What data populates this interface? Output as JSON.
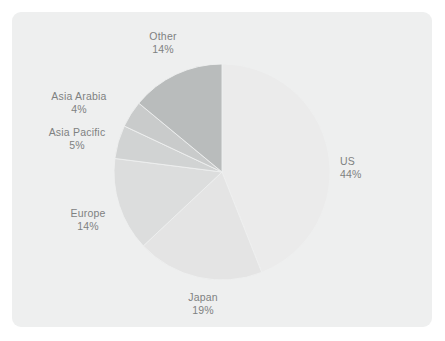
{
  "panel": {
    "background_color": "#eeefef",
    "page_background_color": "#ffffff"
  },
  "chart_data": {
    "type": "pie",
    "title": "",
    "subtitle": "",
    "xlabel": "",
    "ylabel": "",
    "legend_position": "none",
    "grid": false,
    "label_format": "name above percentage",
    "start_angle_deg": 0,
    "direction": "clockwise",
    "categories": [
      "US",
      "Japan",
      "Europe",
      "Asia Pacific",
      "Asia Arabia",
      "Other"
    ],
    "values": [
      44,
      19,
      14,
      5,
      4,
      14
    ],
    "unit": "%",
    "slices": [
      {
        "name": "US",
        "value": 44,
        "value_label": "44%",
        "color": "#ebebeb",
        "start_angle_deg": 0,
        "end_angle_deg": 158.4
      },
      {
        "name": "Japan",
        "value": 19,
        "value_label": "19%",
        "color": "#e4e4e4",
        "start_angle_deg": 158.4,
        "end_angle_deg": 226.8
      },
      {
        "name": "Europe",
        "value": 14,
        "value_label": "14%",
        "color": "#dcdddd",
        "start_angle_deg": 226.8,
        "end_angle_deg": 277.2
      },
      {
        "name": "Asia Pacific",
        "value": 5,
        "value_label": "5%",
        "color": "#d1d3d3",
        "start_angle_deg": 277.2,
        "end_angle_deg": 295.2
      },
      {
        "name": "Asia Arabia",
        "value": 4,
        "value_label": "4%",
        "color": "#c9cbcb",
        "start_angle_deg": 295.2,
        "end_angle_deg": 309.6
      },
      {
        "name": "Other",
        "value": 14,
        "value_label": "14%",
        "color": "#b9bcbc",
        "start_angle_deg": 309.6,
        "end_angle_deg": 360
      }
    ],
    "label_color": "#7e8181",
    "total": 100
  }
}
